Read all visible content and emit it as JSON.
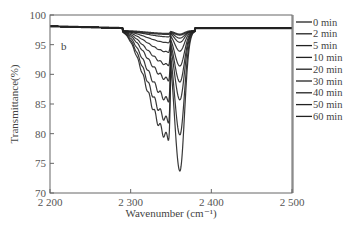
{
  "chart_data": {
    "type": "line",
    "title": "",
    "panel_label": "b",
    "xlabel": "Wavenumber (cm⁻¹)",
    "ylabel": "Transmittance(%)",
    "xlim": [
      2200,
      2500
    ],
    "ylim": [
      70,
      100
    ],
    "xticks": [
      2200,
      2300,
      2400,
      2500
    ],
    "xtick_labels": [
      "2 200",
      "2 300",
      "2 400",
      "2 500"
    ],
    "yticks": [
      70,
      75,
      80,
      85,
      90,
      95,
      100
    ],
    "legend_position": "right-outside",
    "grid": false,
    "series": [
      {
        "name": "0 min",
        "baseline": 97.8,
        "left_min": 97.3,
        "right_min": 97.2
      },
      {
        "name": "2 min",
        "baseline": 97.8,
        "left_min": 96.8,
        "right_min": 96.6
      },
      {
        "name": "5 min",
        "baseline": 97.8,
        "left_min": 95.8,
        "right_min": 95.9
      },
      {
        "name": "10 min",
        "baseline": 97.8,
        "left_min": 94.2,
        "right_min": 94.4
      },
      {
        "name": "20 min",
        "baseline": 97.8,
        "left_min": 92.0,
        "right_min": 91.9
      },
      {
        "name": "30 min",
        "baseline": 97.8,
        "left_min": 89.5,
        "right_min": 89.2
      },
      {
        "name": "40 min",
        "baseline": 97.8,
        "left_min": 86.0,
        "right_min": 86.2
      },
      {
        "name": "50 min",
        "baseline": 97.8,
        "left_min": 82.5,
        "right_min": 80.3
      },
      {
        "name": "60 min",
        "baseline": 97.8,
        "left_min": 79.6,
        "right_min": 74.2
      }
    ],
    "band": {
      "left_center": 2341,
      "right_center": 2361,
      "band_start": 2285,
      "band_end": 2380
    }
  }
}
